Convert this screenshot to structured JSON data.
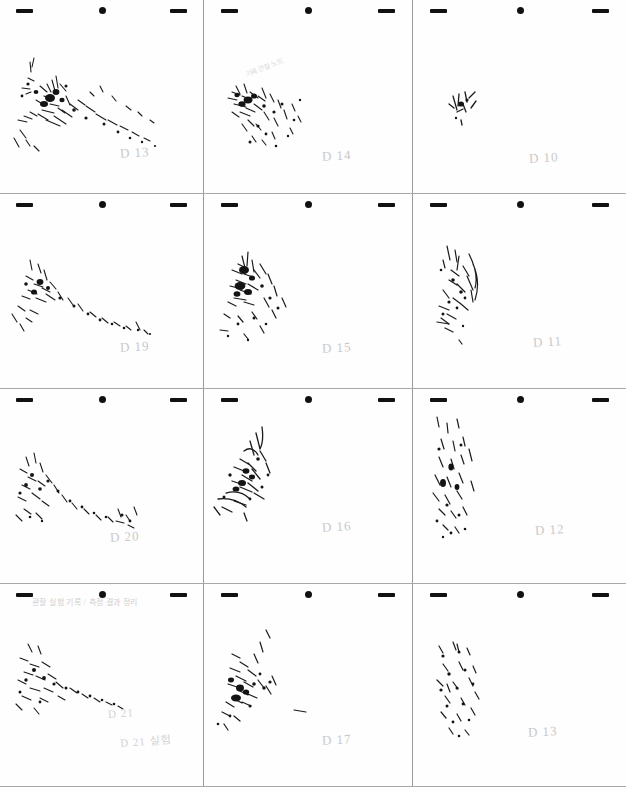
{
  "document": {
    "kind": "scanned-worksheet",
    "page_background": "#fefefe",
    "grid_line_color": "#9a9a9a",
    "ink_color": "#1b1b1b",
    "pencil_label_color": "#c9c9c9",
    "columns": 3,
    "rows": 4
  },
  "registration_marks": {
    "left": "dash-mark",
    "center": "dot-mark",
    "right": "dash-mark"
  },
  "cells": [
    {
      "index": 1,
      "row": 1,
      "col": 1,
      "label": "D 13",
      "label_x": 120,
      "label_y": 145,
      "annotation": "",
      "sketch": "diagonal-ink-spatter-upper-left-to-lower-right"
    },
    {
      "index": 2,
      "row": 1,
      "col": 2,
      "label": "D 14",
      "label_x": 118,
      "label_y": 148,
      "annotation": "handwritten-slanted-note",
      "annotation_text": "기록 관찰 노트",
      "sketch": "dense-cluster-left-with-scatter-below"
    },
    {
      "index": 3,
      "row": 1,
      "col": 3,
      "label": "D 10",
      "label_x": 116,
      "label_y": 150,
      "annotation": "",
      "sketch": "small-compact-mark-center-left"
    },
    {
      "index": 4,
      "row": 2,
      "col": 1,
      "label": "D 19",
      "label_x": 120,
      "label_y": 145,
      "annotation": "",
      "sketch": "loose-diagonal-scatter"
    },
    {
      "index": 5,
      "row": 2,
      "col": 2,
      "label": "D 15",
      "label_x": 118,
      "label_y": 146,
      "annotation": "",
      "sketch": "dense-vertical-cluster-with-radiating-flecks"
    },
    {
      "index": 6,
      "row": 2,
      "col": 3,
      "label": "D 11",
      "label_x": 120,
      "label_y": 140,
      "annotation": "",
      "sketch": "curved-arc-strokes-left-side"
    },
    {
      "index": 7,
      "row": 3,
      "col": 1,
      "label": "D 20",
      "label_x": 110,
      "label_y": 140,
      "annotation": "",
      "sketch": "wide-sparse-spatter-field"
    },
    {
      "index": 8,
      "row": 3,
      "col": 2,
      "label": "D 16",
      "label_x": 118,
      "label_y": 130,
      "annotation": "",
      "sketch": "branching-strokes-upper-left"
    },
    {
      "index": 9,
      "row": 3,
      "col": 3,
      "label": "D 12",
      "label_x": 122,
      "label_y": 133,
      "annotation": "",
      "sketch": "vertical-streaks-and-specks"
    },
    {
      "index": 10,
      "row": 4,
      "col": 1,
      "label": "D 21",
      "label_x": 108,
      "label_y": 123,
      "label_secondary": "D 21 실험",
      "label2_x": 120,
      "label2_y": 148,
      "annotation": "handwritten-korean-note",
      "annotation_text": "관찰 실험 기록 / 측정 결과 정리",
      "sketch": "horizontal-sparse-spray"
    },
    {
      "index": 11,
      "row": 4,
      "col": 2,
      "label": "D 17",
      "label_x": 118,
      "label_y": 148,
      "annotation": "",
      "sketch": "vertical-dense-column-with-flecks"
    },
    {
      "index": 12,
      "row": 4,
      "col": 3,
      "label": "D 13",
      "label_x": 115,
      "label_y": 140,
      "annotation": "",
      "sketch": "scattered-short-dashes-lower-center"
    }
  ]
}
